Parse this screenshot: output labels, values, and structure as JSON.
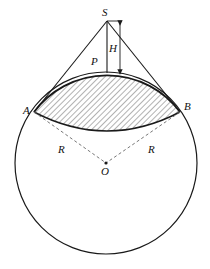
{
  "diagram": {
    "type": "geometry",
    "labels": {
      "S": "S",
      "H": "H",
      "P": "P",
      "A": "A",
      "B": "B",
      "R_left": "R",
      "R_right": "R",
      "O": "O"
    },
    "colors": {
      "stroke": "#1a1a1a",
      "hatch": "#555555",
      "dashed": "#777777",
      "background": "#ffffff"
    }
  }
}
